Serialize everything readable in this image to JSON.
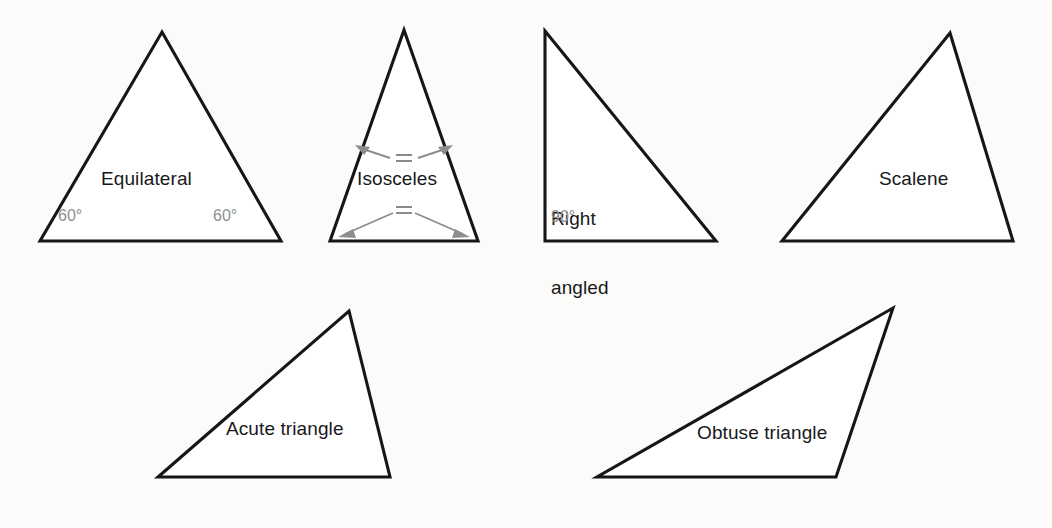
{
  "figure": {
    "background_color": "#fbfbf9",
    "outline_color": "#16161a",
    "fill_color": "#ffffff",
    "annotation_color": "#8d8d8d",
    "label_color": "#18181c"
  },
  "shapes": [
    {
      "key": "equilateral",
      "label": "Equilateral",
      "angles": [
        "60°",
        "60°"
      ],
      "row": "top",
      "vertices": "162,32 281,241 40,241"
    },
    {
      "key": "isosceles",
      "label": "Isosceles",
      "angles": [],
      "equal_marks": [
        "=",
        "="
      ],
      "row": "top",
      "vertices": "404,30 478,241 330,241"
    },
    {
      "key": "right_angled",
      "label": "Right\nangled",
      "label_line1": "Right",
      "label_line2": "angled",
      "angles": [
        "90°"
      ],
      "row": "top",
      "vertices": "545,31 716,241 545,241"
    },
    {
      "key": "scalene",
      "label": "Scalene",
      "angles": [],
      "row": "top",
      "vertices": "950,33 1013,241 782,241"
    },
    {
      "key": "acute",
      "label": "Acute triangle",
      "angles": [],
      "row": "bottom",
      "vertices": "349,311 390,477 158,477"
    },
    {
      "key": "obtuse",
      "label": "Obtuse triangle",
      "angles": [],
      "row": "bottom",
      "vertices": "893,308 836,477 597,477"
    }
  ],
  "labels": {
    "equilateral": "Equilateral",
    "equilateral_angle_left": "60°",
    "equilateral_angle_right": "60°",
    "isosceles": "Isosceles",
    "isosceles_mark_top": "=",
    "isosceles_mark_bottom": "=",
    "right_angled_line1": "Right",
    "right_angled_line2": "angled",
    "right_angled_angle": "90°",
    "scalene": "Scalene",
    "acute": "Acute triangle",
    "obtuse": "Obtuse triangle"
  }
}
